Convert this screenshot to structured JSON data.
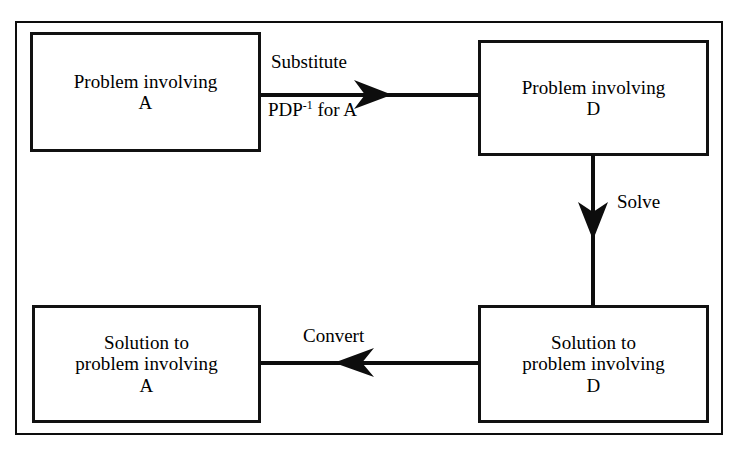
{
  "diagram": {
    "line_color": "#0d0d0d",
    "box_border_color": "#111111",
    "background_color": "#ffffff",
    "nodes": [
      {
        "id": "problem-a",
        "lines": [
          "Problem involving",
          "A"
        ],
        "line1": "Problem involving",
        "line2": "A",
        "line3": ""
      },
      {
        "id": "problem-d",
        "lines": [
          "Problem involving",
          "D"
        ],
        "line1": "Problem involving",
        "line2": "D",
        "line3": ""
      },
      {
        "id": "solution-a",
        "lines": [
          "Solution to",
          "problem involving",
          "A"
        ],
        "line1": "Solution to",
        "line2": "problem involving",
        "line3": "A"
      },
      {
        "id": "solution-d",
        "lines": [
          "Solution to",
          "problem involving",
          "D"
        ],
        "line1": "Solution to",
        "line2": "problem involving",
        "line3": "D"
      }
    ],
    "edges": [
      {
        "id": "substitute",
        "from": "problem-a",
        "to": "problem-d",
        "direction": "right",
        "label_above": "Substitute",
        "label_below_prefix": "PDP",
        "label_below_sup": "-1",
        "label_below_suffix": " for A"
      },
      {
        "id": "solve",
        "from": "problem-d",
        "to": "solution-d",
        "direction": "down",
        "label": "Solve"
      },
      {
        "id": "convert",
        "from": "solution-d",
        "to": "solution-a",
        "direction": "left",
        "label": "Convert"
      }
    ]
  }
}
